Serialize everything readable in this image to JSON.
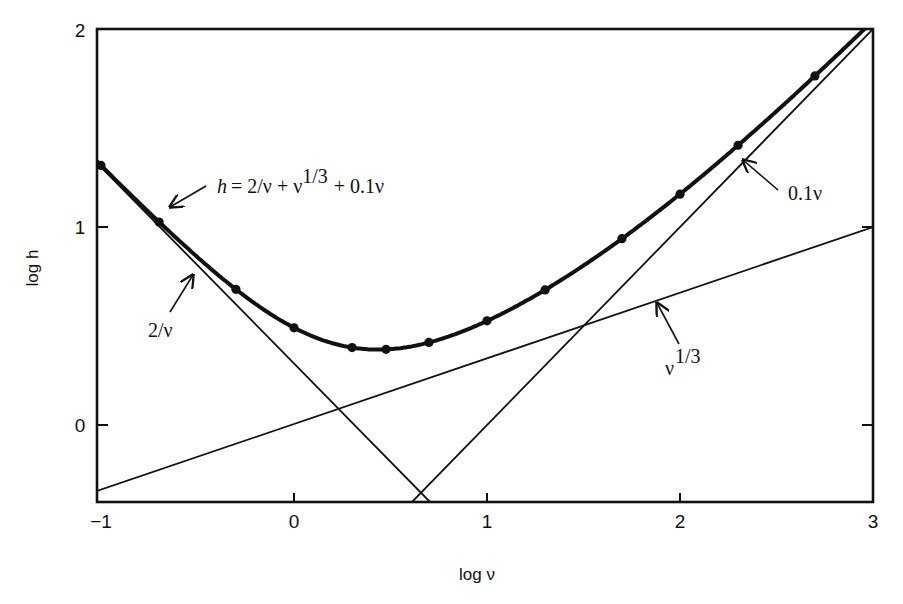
{
  "chart_data": {
    "type": "line",
    "title": "",
    "xlabel": "log ν",
    "ylabel": "log h",
    "xlim": [
      -1,
      3
    ],
    "ylim": [
      -0.39,
      2
    ],
    "grid": false,
    "legend": "none (inline annotations with arrows)",
    "x_ticks": [
      -1,
      0,
      1,
      2,
      3
    ],
    "x_tick_labels": [
      "−1",
      "0",
      "1",
      "2",
      "3"
    ],
    "y_ticks": [
      0,
      1,
      2
    ],
    "y_tick_labels": [
      "0",
      "1",
      "2"
    ],
    "series": [
      {
        "name": "h = 2/ν + ν^1/3 + 0.1ν",
        "style": "thick curve with dot markers",
        "x": [
          -1.0,
          -0.699,
          -0.301,
          0.0,
          0.301,
          0.477,
          0.699,
          1.0,
          1.301,
          1.699,
          2.0,
          2.301,
          2.699
        ],
        "y": [
          1.311,
          1.025,
          0.685,
          0.491,
          0.391,
          0.382,
          0.417,
          0.526,
          0.682,
          0.941,
          1.166,
          1.413,
          1.763
        ]
      },
      {
        "name": "2/ν",
        "style": "thin straight line",
        "x": [
          -1.0,
          0.69
        ],
        "y": [
          1.301,
          -0.39
        ]
      },
      {
        "name": "ν^1/3",
        "style": "thin straight line",
        "x": [
          -1.0,
          3.0
        ],
        "y": [
          -0.333,
          1.0
        ]
      },
      {
        "name": "0.1ν",
        "style": "thin straight line",
        "x": [
          0.61,
          3.0
        ],
        "y": [
          -0.39,
          2.0
        ]
      }
    ],
    "annotations": [
      {
        "text": "h = 2/ν + ν^1/3 + 0.1ν",
        "points_to": "total curve near log ν ≈ −0.65"
      },
      {
        "text": "2/ν",
        "points_to": "2/ν line near log ν ≈ −0.5"
      },
      {
        "text": "ν^1/3",
        "points_to": "ν^1/3 line near log ν ≈ 1.87"
      },
      {
        "text": "0.1ν",
        "points_to": "0.1ν line near log ν ≈ 2.3"
      }
    ]
  },
  "labels": {
    "xlabel": "log ν",
    "ylabel": "log h",
    "x_ticks": [
      "−1",
      "0",
      "1",
      "2",
      "3"
    ],
    "y_ticks": [
      "0",
      "1",
      "2"
    ],
    "formula_h": "h",
    "formula_rest": "= 2/ν + ν",
    "formula_exp": "1/3",
    "formula_tail": "+ 0.1ν",
    "ann_2nu": "2/ν",
    "ann_cube_base": "ν",
    "ann_cube_exp": "1/3",
    "ann_01nu": "0.1ν"
  }
}
